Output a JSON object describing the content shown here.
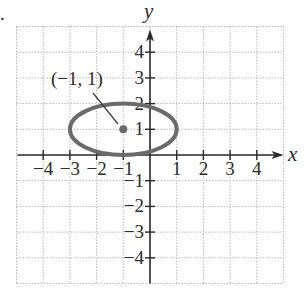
{
  "chart_data": {
    "type": "scatter",
    "title": "",
    "xlabel": "x",
    "ylabel": "y",
    "xlim": [
      -5,
      5
    ],
    "ylim": [
      -5,
      5
    ],
    "grid": true,
    "x_ticks": [
      -4,
      -3,
      -2,
      -1,
      1,
      2,
      3,
      4
    ],
    "y_ticks": [
      -4,
      -3,
      -2,
      -1,
      1,
      2,
      3,
      4
    ],
    "x_tick_labels": [
      "−4",
      "−3",
      "−2",
      "−1",
      "1",
      "2",
      "3",
      "4"
    ],
    "y_tick_labels": [
      "−4",
      "−3",
      "−2",
      "−1",
      "1",
      "2",
      "3",
      "4"
    ],
    "series": [
      {
        "name": "ellipse",
        "shape": "ellipse",
        "center": [
          -1,
          1
        ],
        "semi_axis_x": 2,
        "semi_axis_y": 1,
        "equation": "(x+1)^2/4 + (y-1)^2 = 1",
        "color": "#6b6b6b"
      },
      {
        "name": "center point",
        "shape": "point",
        "x": [
          -1
        ],
        "y": [
          1
        ],
        "color": "#6b6b6b"
      }
    ],
    "annotations": [
      {
        "text": "(−1, 1)",
        "points_to": [
          -1,
          1
        ]
      }
    ],
    "legend": null
  },
  "labels": {
    "x_axis": "x",
    "y_axis": "y",
    "center_annotation": "(−1, 1)",
    "figure_marker": "."
  }
}
